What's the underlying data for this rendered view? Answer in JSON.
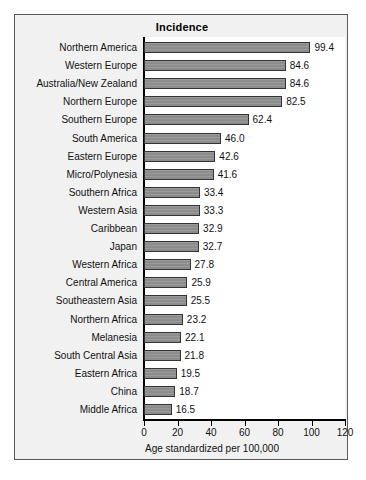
{
  "chart_data": {
    "type": "bar",
    "orientation": "horizontal",
    "title": "Incidence",
    "xlabel": "Age standardized per 100,000",
    "ylabel": "",
    "xlim": [
      0,
      120
    ],
    "xticks": [
      0,
      20,
      40,
      60,
      80,
      100,
      120
    ],
    "grid": false,
    "legend": null,
    "bar_color": "#8c8c8c",
    "bar_edge_color": "#333333",
    "categories": [
      "Northern America",
      "Western Europe",
      "Australia/New Zealand",
      "Northern Europe",
      "Southern Europe",
      "South America",
      "Eastern Europe",
      "Micro/Polynesia",
      "Southern Africa",
      "Western Asia",
      "Caribbean",
      "Japan",
      "Western Africa",
      "Central America",
      "Southeastern Asia",
      "Northern Africa",
      "Melanesia",
      "South Central Asia",
      "Eastern Africa",
      "China",
      "Middle Africa"
    ],
    "values": [
      99.4,
      84.6,
      84.6,
      82.5,
      62.4,
      46.0,
      42.6,
      41.6,
      33.4,
      33.3,
      32.9,
      32.7,
      27.8,
      25.9,
      25.5,
      23.2,
      22.1,
      21.8,
      19.5,
      18.7,
      16.5
    ],
    "value_labels": [
      "99.4",
      "84.6",
      "84.6",
      "82.5",
      "62.4",
      "46.0",
      "42.6",
      "41.6",
      "33.4",
      "33.3",
      "32.9",
      "32.7",
      "27.8",
      "25.9",
      "25.5",
      "23.2",
      "22.1",
      "21.8",
      "19.5",
      "18.7",
      "16.5"
    ],
    "xtick_labels": [
      "0",
      "20",
      "40",
      "60",
      "80",
      "100",
      "120"
    ]
  }
}
